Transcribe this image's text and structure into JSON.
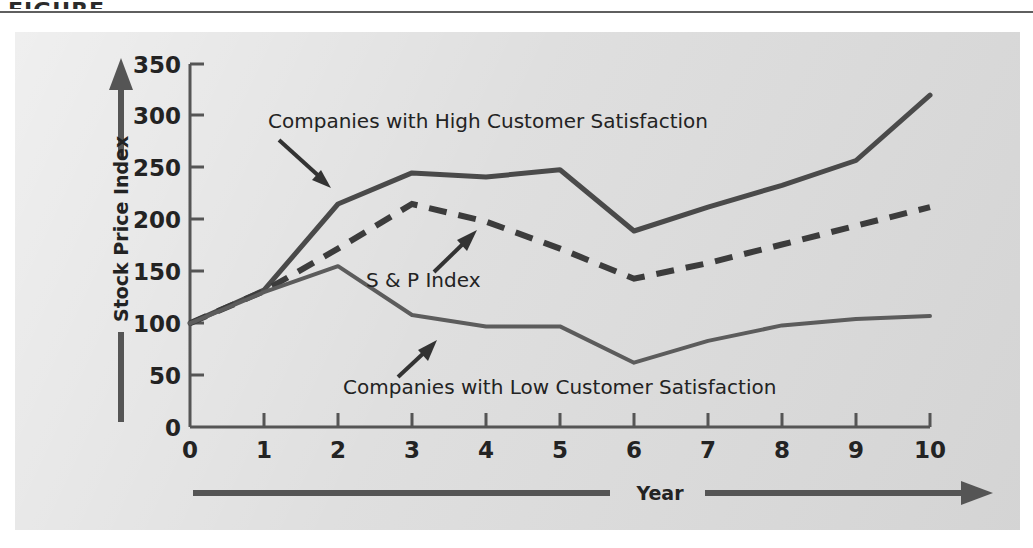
{
  "header": {
    "clipped_text": "FIGURE"
  },
  "chart_data": {
    "type": "line",
    "title": "",
    "xlabel": "Year",
    "ylabel": "Stock Price Index",
    "x": [
      0,
      1,
      2,
      3,
      4,
      5,
      6,
      7,
      8,
      9,
      10
    ],
    "xlim": [
      0,
      10
    ],
    "ylim": [
      0,
      350
    ],
    "xticks": [
      "0",
      "1",
      "2",
      "3",
      "4",
      "5",
      "6",
      "7",
      "8",
      "9",
      "10"
    ],
    "yticks": [
      "0",
      "50",
      "100",
      "150",
      "200",
      "250",
      "300",
      "350"
    ],
    "grid": false,
    "legend": "annotations-with-arrows",
    "series": [
      {
        "name": "Companies with High Customer Satisfaction",
        "style": "solid",
        "color": "#4a4a4a",
        "values": [
          100,
          132,
          215,
          245,
          241,
          248,
          189,
          212,
          233,
          257,
          320
        ]
      },
      {
        "name": "S & P Index",
        "style": "dashed",
        "color": "#3c3c3c",
        "values": [
          100,
          131,
          172,
          215,
          198,
          172,
          143,
          158,
          176,
          194,
          212
        ]
      },
      {
        "name": "Companies with Low Customer Satisfaction",
        "style": "solid",
        "color": "#5c5c5c",
        "values": [
          100,
          130,
          155,
          108,
          97,
          97,
          62,
          83,
          98,
          104,
          107
        ]
      }
    ],
    "annotations": [
      {
        "id": "high-satisfaction-label",
        "text": "Companies with High Customer Satisfaction",
        "arrow": "down-right"
      },
      {
        "id": "sp-index-label",
        "text": "S & P Index",
        "arrow": "up-right"
      },
      {
        "id": "low-satisfaction-label",
        "text": "Companies with Low Customer Satisfaction",
        "arrow": "up-right"
      }
    ]
  },
  "colors": {
    "panel_background": "#dcdcdc",
    "page_background": "#ffffff",
    "axis": "#555555",
    "text": "#232323",
    "high_series": "#4a4a4a",
    "sp_series": "#3c3c3c",
    "low_series": "#5c5c5c"
  }
}
